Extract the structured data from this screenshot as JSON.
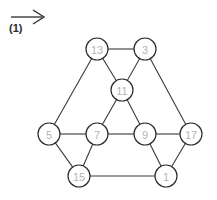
{
  "annotation": {
    "arrow_name": "right-arrow-icon",
    "label": "(1)",
    "arrow_color": "#2a2a2a"
  },
  "graph": {
    "node_fill": "#ffffff",
    "node_stroke": "#2b2b2b",
    "label_color": "#b4b4b4",
    "edge_color": "#3a3a3a",
    "node_radius": 11,
    "nodes": [
      {
        "id": "n13",
        "label": "13",
        "x": 97,
        "y": 49
      },
      {
        "id": "n3",
        "label": "3",
        "x": 145,
        "y": 49
      },
      {
        "id": "n11",
        "label": "11",
        "x": 122,
        "y": 90
      },
      {
        "id": "n5",
        "label": "5",
        "x": 49,
        "y": 134
      },
      {
        "id": "n7",
        "label": "7",
        "x": 97,
        "y": 134
      },
      {
        "id": "n9",
        "label": "9",
        "x": 145,
        "y": 134
      },
      {
        "id": "n17",
        "label": "17",
        "x": 191,
        "y": 134
      },
      {
        "id": "n15",
        "label": "15",
        "x": 79,
        "y": 176
      },
      {
        "id": "n1",
        "label": "1",
        "x": 166,
        "y": 176
      }
    ],
    "edges": [
      {
        "from": "n13",
        "to": "n3"
      },
      {
        "from": "n13",
        "to": "n11"
      },
      {
        "from": "n13",
        "to": "n5"
      },
      {
        "from": "n3",
        "to": "n11"
      },
      {
        "from": "n3",
        "to": "n17"
      },
      {
        "from": "n11",
        "to": "n7"
      },
      {
        "from": "n11",
        "to": "n9"
      },
      {
        "from": "n5",
        "to": "n7"
      },
      {
        "from": "n7",
        "to": "n9"
      },
      {
        "from": "n9",
        "to": "n17"
      },
      {
        "from": "n5",
        "to": "n15"
      },
      {
        "from": "n7",
        "to": "n15"
      },
      {
        "from": "n9",
        "to": "n1"
      },
      {
        "from": "n17",
        "to": "n1"
      },
      {
        "from": "n15",
        "to": "n1"
      }
    ]
  }
}
